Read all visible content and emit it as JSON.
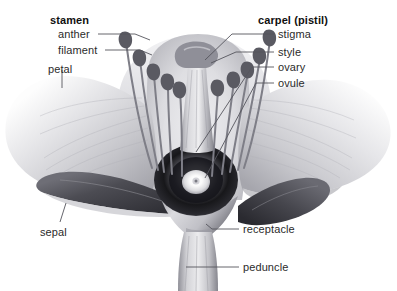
{
  "diagram": {
    "background_color": "#ffffff",
    "text_color": "#2b2b2b",
    "labels": [
      {
        "id": "stamen",
        "text": "stamen",
        "bold": true,
        "x": 50,
        "y": 14
      },
      {
        "id": "anther",
        "text": "anther",
        "bold": false,
        "x": 58,
        "y": 29
      },
      {
        "id": "filament",
        "text": "filament",
        "bold": false,
        "x": 58,
        "y": 45
      },
      {
        "id": "petal",
        "text": "petal",
        "bold": false,
        "x": 48,
        "y": 64
      },
      {
        "id": "sepal",
        "text": "sepal",
        "bold": false,
        "x": 40,
        "y": 227
      },
      {
        "id": "carpel",
        "text": "carpel (pistil)",
        "bold": true,
        "x": 258,
        "y": 14
      },
      {
        "id": "stigma",
        "text": "stigma",
        "bold": false,
        "x": 278,
        "y": 29
      },
      {
        "id": "style",
        "text": "style",
        "bold": false,
        "x": 278,
        "y": 47
      },
      {
        "id": "ovary",
        "text": "ovary",
        "bold": false,
        "x": 278,
        "y": 62
      },
      {
        "id": "ovule",
        "text": "ovule",
        "bold": false,
        "x": 278,
        "y": 78
      },
      {
        "id": "receptacle",
        "text": "receptacle",
        "bold": false,
        "x": 243,
        "y": 224
      },
      {
        "id": "peduncle",
        "text": "peduncle",
        "bold": false,
        "x": 243,
        "y": 262
      }
    ],
    "leaders": [
      {
        "id": "leader-anther",
        "points": "98,34 135,34 150,40"
      },
      {
        "id": "leader-filament",
        "points": "105,50 140,50 152,55"
      },
      {
        "id": "leader-petal",
        "points": "62,70 62,88"
      },
      {
        "id": "leader-sepal",
        "points": "60,222 66,203"
      },
      {
        "id": "leader-stigma",
        "points": "274,34 232,34 205,60"
      },
      {
        "id": "leader-style",
        "points": "274,52 236,52 211,63"
      },
      {
        "id": "leader-ovary",
        "points": "274,67 252,67 196,152"
      },
      {
        "id": "leader-ovule",
        "points": "274,83 256,83 205,178"
      },
      {
        "id": "leader-receptacle",
        "points": "239,229 212,229 206,224"
      },
      {
        "id": "leader-peduncle",
        "points": "239,267 186,267"
      }
    ],
    "parts": {
      "petal_left": "petal-left",
      "petal_right": "petal-right",
      "sepal_left": "sepal-left",
      "sepal_right": "sepal-right",
      "ovary": "ovary",
      "ovule": "ovule",
      "style": "style",
      "stigma": "stigma",
      "receptacle": "receptacle",
      "peduncle": "peduncle",
      "stamens": "stamen-cluster"
    },
    "colors": {
      "line": "#5a5a60",
      "petal_light": "#e8e8ea",
      "petal_mid": "#c9c9cd",
      "petal_shadow": "#9a9aa0",
      "sepal_dark": "#4a4a50",
      "ovary_dark": "#1d1d20",
      "ovule_white": "#fbfbfb",
      "stem_gray": "#b8b8bc",
      "anther_dark": "#55555c"
    }
  }
}
